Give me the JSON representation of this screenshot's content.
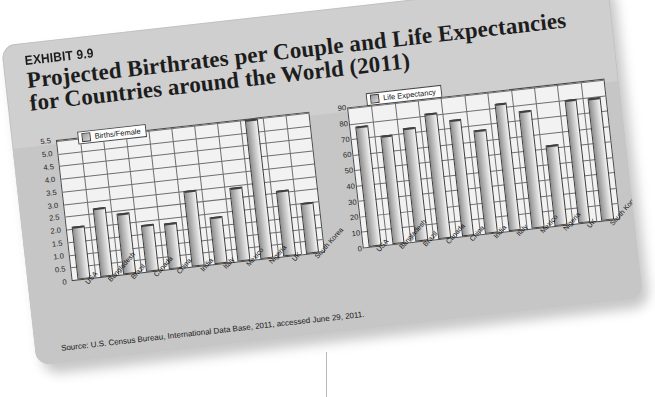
{
  "exhibit": {
    "kicker": "EXHIBIT 9.9",
    "title_line1": "Projected Birthrates per Couple and Life Expectancies",
    "title_line2": "for Countries around the World (2011)",
    "source": "Source:  U.S. Census Bureau, International Data Base, 2011, accessed June 29, 2011."
  },
  "colors": {
    "card_upper": "#cfcfcf",
    "card_lower": "#c6c6c6",
    "plot_background": "#f2f2f2",
    "axis": "#4a4a4a",
    "gridline": "#6f6f6f",
    "bar_dark": "#8f8f8f",
    "bar_light": "#f4f4f4",
    "text": "#1b1b1b"
  },
  "chart_data": [
    {
      "type": "bar",
      "id": "births-per-female",
      "title": "",
      "legend": "Births/Female",
      "legend_position": "top-left-inside",
      "grid": true,
      "xlabel": "",
      "ylabel": "",
      "ylim": [
        0,
        5.5
      ],
      "ytick_step": 0.5,
      "yticks": [
        "0",
        "0.5",
        "1.0",
        "1.5",
        "2.0",
        "2.5",
        "3.0",
        "3.5",
        "4.0",
        "4.5",
        "5.0",
        "5.5"
      ],
      "categories": [
        "USA",
        "Bangladesh",
        "Brazil",
        "Canada",
        "China",
        "India",
        "Italy",
        "Mexico",
        "Nigeria",
        "UK",
        "South Korea"
      ],
      "values": [
        2.1,
        2.7,
        2.4,
        1.85,
        1.8,
        3.0,
        1.85,
        2.9,
        5.5,
        2.6,
        2.0
      ]
    },
    {
      "type": "bar",
      "id": "life-expectancy",
      "title": "",
      "legend": "Life Expectancy",
      "legend_position": "top-left-inside",
      "grid": true,
      "xlabel": "",
      "ylabel": "",
      "ylim": [
        0,
        90
      ],
      "ytick_step": 10,
      "yticks": [
        "0",
        "10",
        "20",
        "30",
        "40",
        "50",
        "60",
        "70",
        "80",
        "90"
      ],
      "categories": [
        "USA",
        "Bangladesh",
        "Brazil",
        "Canada",
        "China",
        "India",
        "Italy",
        "Mexico",
        "Nigeria",
        "UK",
        "South Korea"
      ],
      "values": [
        78,
        70,
        73,
        81,
        75,
        67,
        82,
        76,
        52,
        80,
        79
      ]
    }
  ]
}
